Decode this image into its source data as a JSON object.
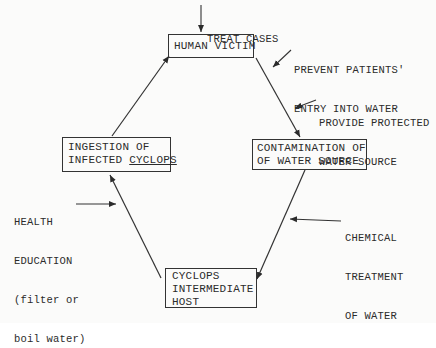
{
  "diagram": {
    "type": "cycle-flowchart",
    "nodes": {
      "human_victim": {
        "lines": [
          "HUMAN VICTIM"
        ]
      },
      "contamination": {
        "lines": [
          "CONTAMINATION OF",
          "OF WATER SOURCE"
        ]
      },
      "cyclops_host": {
        "lines": [
          "CYCLOPS",
          "INTERMEDIATE",
          "HOST"
        ]
      },
      "ingestion": {
        "line1": "INGESTION OF",
        "line2_prefix": "INFECTED ",
        "line2_underlined": "CYCLOPS"
      }
    },
    "interventions": {
      "treat_cases": {
        "lines": [
          "TREAT CASES"
        ]
      },
      "prevent_entry": {
        "lines": [
          "PREVENT PATIENTS'",
          "ENTRY INTO WATER"
        ]
      },
      "protected_source": {
        "lines": [
          "PROVIDE PROTECTED",
          "WATER SOURCE"
        ]
      },
      "chemical_treatment": {
        "lines": [
          "CHEMICAL",
          "TREATMENT",
          "OF WATER"
        ]
      },
      "health_education": {
        "lines": [
          "HEALTH",
          "EDUCATION",
          "(filter or",
          "boil water)"
        ]
      }
    },
    "edges": [
      {
        "from": "human_victim",
        "to": "contamination"
      },
      {
        "from": "contamination",
        "to": "cyclops_host"
      },
      {
        "from": "cyclops_host",
        "to": "ingestion"
      },
      {
        "from": "ingestion",
        "to": "human_victim"
      }
    ],
    "colors": {
      "ink": "#2b2b2b",
      "paper": "#fbfbfa"
    }
  }
}
